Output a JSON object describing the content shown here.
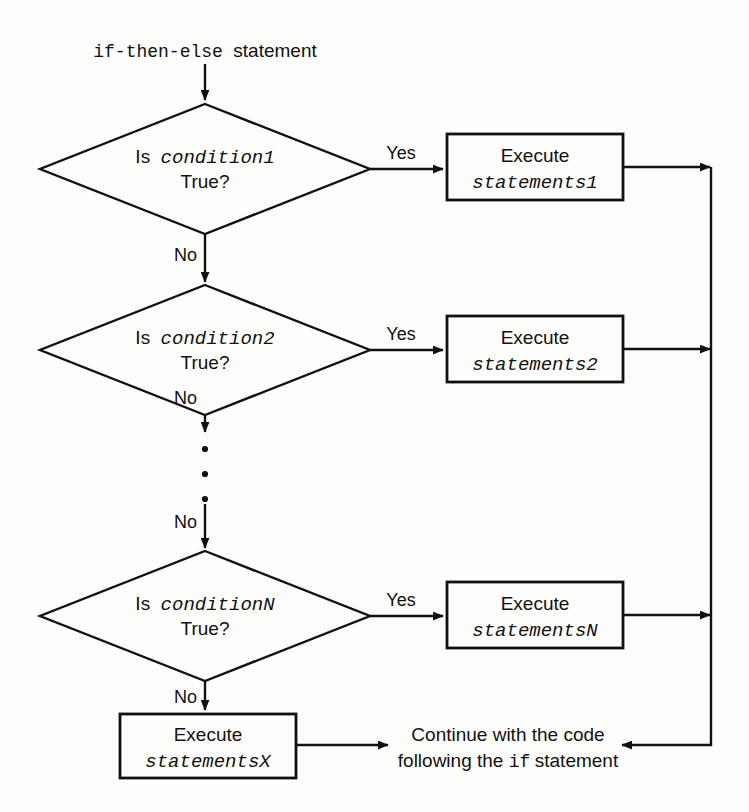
{
  "diagram": {
    "title_mono": "if-then-else",
    "title_sans": "statement",
    "colors": {
      "stroke": "#111111",
      "background": "#fdfdfb",
      "fill": "#fdfdfb"
    },
    "decisions": [
      {
        "id": "condition1",
        "line1_prefix": "Is",
        "line1_var": "condition1",
        "line2": "True?",
        "yes_label": "Yes",
        "no_label": "No"
      },
      {
        "id": "condition2",
        "line1_prefix": "Is",
        "line1_var": "condition2",
        "line2": "True?",
        "yes_label": "Yes",
        "no_label": "No"
      },
      {
        "id": "conditionN",
        "line1_prefix": "Is",
        "line1_var": "conditionN",
        "line2": "True?",
        "yes_label": "Yes",
        "no_label": "No"
      }
    ],
    "processes": [
      {
        "id": "statements1",
        "line1": "Execute",
        "line2": "statements1"
      },
      {
        "id": "statements2",
        "line1": "Execute",
        "line2": "statements2"
      },
      {
        "id": "statementsN",
        "line1": "Execute",
        "line2": "statementsN"
      },
      {
        "id": "statementsX",
        "line1": "Execute",
        "line2": "statementsX"
      }
    ],
    "ellipsis_label": "vertical-ellipsis",
    "continue_text": {
      "line1": "Continue with the code",
      "line2_before": "following the ",
      "line2_mono": "if",
      "line2_after": " statement"
    }
  }
}
